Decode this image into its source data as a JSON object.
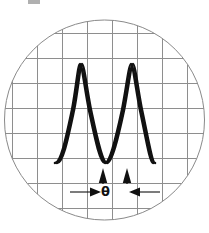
{
  "figure": {
    "name": "oscilloscope-phase-shift-display",
    "kind": "diagram",
    "caption_mark": ""
  },
  "screen": {
    "shape": "circle",
    "center_x": 104.5,
    "center_y": 120,
    "radius": 100,
    "outline_color": "#8a8a8a",
    "fill_color": "#ffffff",
    "outline_width": 1
  },
  "graticule": {
    "color": "#8e8e8e",
    "line_width": 1,
    "vertical_x": [
      12,
      37,
      62,
      87,
      112,
      137,
      162,
      187
    ],
    "horizontal_y": [
      33,
      58,
      83,
      108,
      133,
      158,
      183,
      208
    ],
    "spacing_px": 25
  },
  "traces": {
    "color": "#111111",
    "line_width": 2.6,
    "baseline_y": 163,
    "peak_y": 64,
    "amplitude_px": 49.5,
    "period_px": 100,
    "series": [
      {
        "name": "trace-a",
        "label": "Reference waveform",
        "phase_offset_px": 0,
        "start_x": 55,
        "end_x": 153,
        "crest_x": 80
      },
      {
        "name": "trace-b",
        "label": "Phase shifted waveform",
        "phase_offset_px": 22,
        "start_x": 57,
        "end_x": 155,
        "crest_x": 102
      }
    ]
  },
  "markers": [
    {
      "name": "marker-left",
      "shape": "triangle-up",
      "x": 103,
      "tip_y": 169,
      "base_y": 183,
      "width": 9,
      "color": "#111111"
    },
    {
      "name": "marker-right",
      "shape": "triangle-up",
      "x": 127,
      "tip_y": 169,
      "base_y": 183,
      "width": 9,
      "color": "#111111"
    }
  ],
  "dimension": {
    "name": "phase-angle-dimension",
    "symbol": "θ",
    "symbol_meaning": "theta phase angle",
    "y": 192,
    "left_arrow": {
      "name": "dimension-arrow-left",
      "tail_x": 74,
      "head_x": 100,
      "direction": "right"
    },
    "right_arrow": {
      "name": "dimension-arrow-right",
      "tail_x": 156,
      "head_x": 130,
      "direction": "left"
    },
    "color": "#111111"
  },
  "colors": {
    "graticule": "#8e8e8e",
    "bezel": "#8a8a8a",
    "trace": "#111111",
    "background": "#ffffff"
  }
}
